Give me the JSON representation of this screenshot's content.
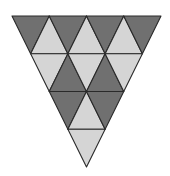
{
  "figure": {
    "geometry": {
      "top_y": 16,
      "bottom_y": 167,
      "left_x": 12,
      "right_x": 161,
      "rows": 4
    },
    "colors": {
      "dark": "#707070",
      "light": "#d5d5d5",
      "stroke": "#2a2a2a"
    },
    "rows": [
      [
        "dark",
        "light",
        "dark",
        "light",
        "dark",
        "light",
        "dark"
      ],
      [
        "light",
        "dark",
        "light",
        "dark",
        "light"
      ],
      [
        "dark",
        "light",
        "dark"
      ],
      [
        "light"
      ]
    ]
  }
}
